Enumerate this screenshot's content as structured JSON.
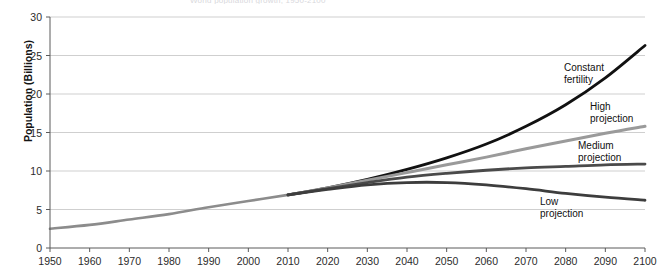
{
  "chart_data": {
    "type": "line",
    "title": "World population growth, 1950-2100",
    "xlabel": "",
    "ylabel": "Population (Billions)",
    "xlim": [
      1950,
      2100
    ],
    "ylim": [
      0,
      30
    ],
    "ytick_step": 5,
    "xtick_step": 10,
    "grid": true,
    "legend_position": "inline-right",
    "x": [
      1950,
      1960,
      1970,
      1980,
      1990,
      2000,
      2010,
      2020,
      2030,
      2040,
      2050,
      2060,
      2070,
      2080,
      2090,
      2100
    ],
    "yticks": [
      "0",
      "5",
      "10",
      "15",
      "20",
      "25",
      "30"
    ],
    "xticks": [
      "1950",
      "1960",
      "1970",
      "1980",
      "1990",
      "2000",
      "2010",
      "2020",
      "2030",
      "2040",
      "2050",
      "2060",
      "2070",
      "2080",
      "2090",
      "2100"
    ],
    "series": [
      {
        "name": "Historical",
        "label": "",
        "color": "#8c8c8c",
        "width": 2.6,
        "x": [
          1950,
          1960,
          1970,
          1980,
          1990,
          2000,
          2010
        ],
        "values": [
          2.5,
          3.0,
          3.7,
          4.4,
          5.3,
          6.1,
          6.9
        ]
      },
      {
        "name": "Constant fertility",
        "label": "Constant\nfertility",
        "color": "#111111",
        "width": 2.8,
        "x": [
          2010,
          2020,
          2030,
          2040,
          2050,
          2060,
          2070,
          2080,
          2090,
          2100
        ],
        "values": [
          6.9,
          7.8,
          8.9,
          10.2,
          11.7,
          13.5,
          15.8,
          18.6,
          22.1,
          26.3
        ]
      },
      {
        "name": "High projection",
        "label": "High\nprojection",
        "color": "#9a9a9a",
        "width": 3.0,
        "x": [
          2010,
          2020,
          2030,
          2040,
          2050,
          2060,
          2070,
          2080,
          2090,
          2100
        ],
        "values": [
          6.9,
          7.8,
          8.8,
          9.8,
          10.8,
          11.8,
          12.9,
          13.9,
          14.9,
          15.8
        ]
      },
      {
        "name": "Medium projection",
        "label": "Medium\nprojection",
        "color": "#4a4a4a",
        "width": 2.8,
        "x": [
          2010,
          2020,
          2030,
          2040,
          2050,
          2060,
          2070,
          2080,
          2090,
          2100
        ],
        "values": [
          6.9,
          7.7,
          8.5,
          9.2,
          9.7,
          10.1,
          10.4,
          10.6,
          10.8,
          10.9
        ]
      },
      {
        "name": "Low projection",
        "label": "Low\nprojection",
        "color": "#3d3d3d",
        "width": 2.8,
        "x": [
          2010,
          2020,
          2030,
          2040,
          2050,
          2060,
          2070,
          2080,
          2090,
          2100
        ],
        "values": [
          6.9,
          7.6,
          8.2,
          8.5,
          8.5,
          8.2,
          7.7,
          7.1,
          6.6,
          6.2
        ]
      }
    ],
    "annotations": [
      {
        "name": "constant-fertility",
        "text": "Constant\nfertility",
        "x": 564,
        "y": 62
      },
      {
        "name": "high-projection",
        "text": "High\nprojection",
        "x": 590,
        "y": 101
      },
      {
        "name": "medium-projection",
        "text": "Medium\nprojection",
        "x": 578,
        "y": 140
      },
      {
        "name": "low-projection",
        "text": "Low\nprojection",
        "x": 540,
        "y": 196
      }
    ]
  }
}
